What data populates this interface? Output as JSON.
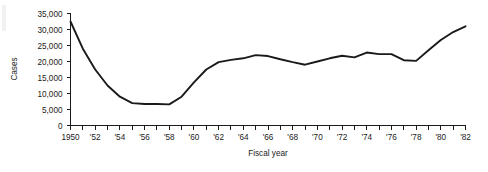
{
  "chart_data": {
    "type": "line",
    "title": "",
    "xlabel": "Fiscal year",
    "ylabel": "Cases",
    "xlim": [
      1950,
      1982
    ],
    "ylim": [
      0,
      35000
    ],
    "grid": false,
    "legend": "none",
    "y_ticks": [
      0,
      5000,
      10000,
      15000,
      20000,
      25000,
      30000,
      35000
    ],
    "y_tick_labels": [
      "0",
      "5,000",
      "10,000",
      "15,000",
      "20,000",
      "25,000",
      "30,000",
      "35,000"
    ],
    "x_ticks": [
      1950,
      1951,
      1952,
      1953,
      1954,
      1955,
      1956,
      1957,
      1958,
      1959,
      1960,
      1961,
      1962,
      1963,
      1964,
      1965,
      1966,
      1967,
      1968,
      1969,
      1970,
      1971,
      1972,
      1973,
      1974,
      1975,
      1976,
      1977,
      1978,
      1979,
      1980,
      1981,
      1982
    ],
    "x_tick_labels": [
      "1950",
      "",
      "'52",
      "",
      "'54",
      "",
      "'56",
      "",
      "'58",
      "",
      "'60",
      "",
      "'62",
      "",
      "'64",
      "",
      "'66",
      "",
      "'68",
      "",
      "'70",
      "",
      "'72",
      "",
      "'74",
      "",
      "'76",
      "",
      "'78",
      "",
      "'80",
      "",
      "'82"
    ],
    "x": [
      1950,
      1951,
      1952,
      1953,
      1954,
      1955,
      1956,
      1957,
      1958,
      1959,
      1960,
      1961,
      1962,
      1963,
      1964,
      1965,
      1966,
      1967,
      1968,
      1969,
      1970,
      1971,
      1972,
      1973,
      1974,
      1975,
      1976,
      1977,
      1978,
      1979,
      1980,
      1981,
      1982
    ],
    "values": [
      32500,
      24000,
      17500,
      12500,
      9000,
      7000,
      6700,
      6700,
      6600,
      9000,
      13500,
      17500,
      19800,
      20500,
      21000,
      22000,
      21700,
      20700,
      19800,
      19000,
      20000,
      21000,
      21800,
      21300,
      22800,
      22300,
      22300,
      20400,
      20200,
      23500,
      26700,
      29200,
      31000
    ],
    "series_name": "Cases",
    "line_color": "#1a1a1a"
  }
}
